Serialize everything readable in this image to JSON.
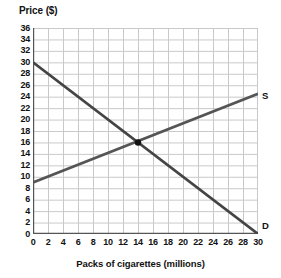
{
  "chart_data": {
    "type": "line",
    "title": "",
    "xlabel": "Packs of cigarettes (millions)",
    "ylabel": "Price ($)",
    "xlim": [
      0,
      30
    ],
    "ylim": [
      0,
      36
    ],
    "xticks": [
      0,
      2,
      4,
      6,
      8,
      10,
      12,
      14,
      16,
      18,
      20,
      22,
      24,
      26,
      28,
      30
    ],
    "yticks": [
      0,
      2,
      4,
      6,
      8,
      10,
      12,
      14,
      16,
      18,
      20,
      22,
      24,
      26,
      28,
      30,
      32,
      34,
      36
    ],
    "grid": true,
    "legend": "inline-end-labels",
    "series": [
      {
        "name": "D",
        "label": "D",
        "description": "Demand curve",
        "color": "#444444",
        "points": [
          [
            0,
            30
          ],
          [
            30,
            0
          ]
        ]
      },
      {
        "name": "S",
        "label": "S",
        "description": "Supply curve",
        "color": "#555555",
        "points": [
          [
            0,
            9
          ],
          [
            30,
            24.5
          ]
        ]
      }
    ],
    "annotations": [
      {
        "name": "equilibrium-point",
        "type": "point-marker",
        "x": 14,
        "y": 16,
        "color": "#111111"
      }
    ]
  },
  "axes": {
    "y_title": "Price ($)",
    "x_title": "Packs of cigarettes (millions)",
    "y_tick_labels": [
      "36",
      "34",
      "32",
      "30",
      "28",
      "26",
      "24",
      "22",
      "20",
      "18",
      "16",
      "14",
      "12",
      "10",
      "8",
      "6",
      "4",
      "2",
      "0"
    ],
    "x_tick_labels": [
      "0",
      "2",
      "4",
      "6",
      "8",
      "10",
      "12",
      "14",
      "16",
      "18",
      "20",
      "22",
      "24",
      "26",
      "28",
      "30"
    ]
  },
  "labels": {
    "supply": "S",
    "demand": "D"
  },
  "colors": {
    "background": "#ffffff",
    "grid": "#c9c9c9",
    "axis": "#555555",
    "demand_line": "#3f3f3f",
    "supply_line": "#5a5a5a",
    "marker": "#111111",
    "text": "#111111"
  }
}
